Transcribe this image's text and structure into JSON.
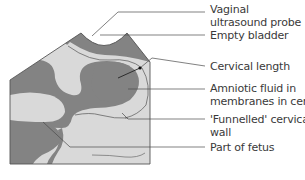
{
  "colors": {
    "tissue_light": "#d9d9d9",
    "tissue_dark": "#838383",
    "outline": "#555555",
    "leader": "#4a4a4a",
    "text": "#3a3a3a"
  },
  "labels": [
    {
      "id": "probe",
      "lines": [
        "Vaginal",
        "ultrasound probe"
      ]
    },
    {
      "id": "bladder",
      "lines": [
        "Empty bladder"
      ]
    },
    {
      "id": "cervical-length",
      "lines": [
        "Cervical length"
      ]
    },
    {
      "id": "amniotic-fluid",
      "lines": [
        "Amniotic fluid in",
        "membranes in cervix"
      ]
    },
    {
      "id": "funnelled-wall",
      "lines": [
        "'Funnelled' cervical",
        "wall"
      ]
    },
    {
      "id": "fetus",
      "lines": [
        "Part of fetus"
      ]
    }
  ]
}
